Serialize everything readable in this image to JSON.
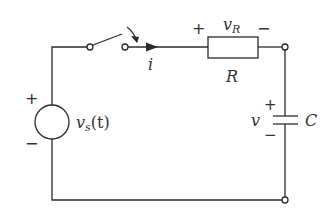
{
  "diagram": {
    "type": "circuit",
    "components": {
      "source": {
        "label_main": "v",
        "label_sub": "s",
        "label_arg": "(t)",
        "plus": "+",
        "minus": "−"
      },
      "switch": {
        "state": "closing"
      },
      "current": {
        "label": "i"
      },
      "resistor": {
        "label": "R",
        "voltage_main": "v",
        "voltage_sub": "R",
        "plus": "+",
        "minus": "−"
      },
      "capacitor": {
        "label": "C",
        "voltage": "v",
        "plus": "+",
        "minus": "−"
      }
    },
    "colors": {
      "stroke": "#2a2a2a",
      "text": "#333333",
      "background": "#ffffff"
    }
  }
}
